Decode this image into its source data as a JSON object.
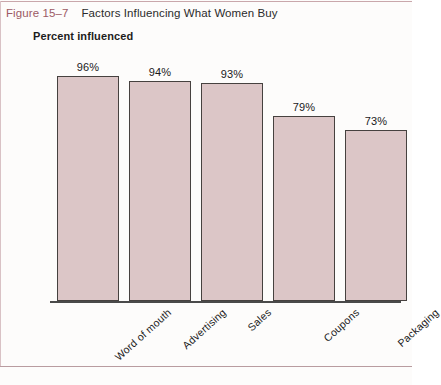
{
  "figure": {
    "number": "Figure 15–7",
    "title": "Factors Influencing What Women Buy",
    "number_color": "#9c5a64"
  },
  "chart_data": {
    "type": "bar",
    "title": "Factors Influencing What Women Buy",
    "xlabel": "",
    "ylabel": "Percent influenced",
    "ylim": [
      0,
      100
    ],
    "grid": false,
    "legend": "none",
    "bar_fill_color": "#dcc6c7",
    "bar_border_color": "#46413f",
    "categories": [
      "Word of mouth",
      "Advertising",
      "Sales",
      "Coupons",
      "Packaging"
    ],
    "values": [
      96,
      94,
      93,
      79,
      73
    ],
    "value_labels": [
      "96%",
      "94%",
      "93%",
      "79%",
      "73%"
    ]
  }
}
